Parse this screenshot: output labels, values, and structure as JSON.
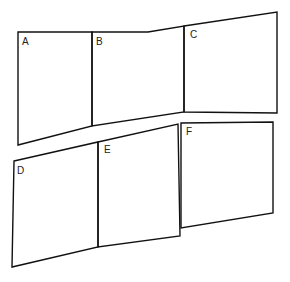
{
  "diagram": {
    "panels": [
      {
        "id": "A",
        "label": "A",
        "label_pos": [
          22,
          36
        ]
      },
      {
        "id": "B",
        "label": "B",
        "label_pos": [
          96,
          37
        ]
      },
      {
        "id": "C",
        "label": "C",
        "label_pos": [
          189,
          30
        ]
      },
      {
        "id": "D",
        "label": "D",
        "label_pos": [
          17,
          165
        ]
      },
      {
        "id": "E",
        "label": "E",
        "label_pos": [
          103,
          145
        ]
      },
      {
        "id": "F",
        "label": "F",
        "label_pos": [
          185,
          126
        ]
      }
    ],
    "stroke_color": "#111111",
    "background": "#ffffff"
  }
}
